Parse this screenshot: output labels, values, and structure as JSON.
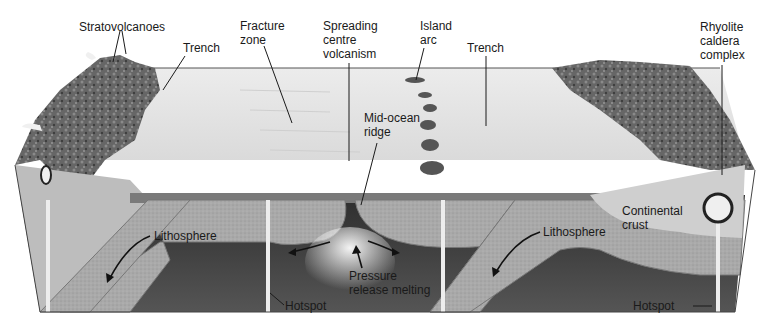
{
  "labels": {
    "stratovolcanoes": "Stratovolcanoes",
    "trench_left": "Trench",
    "fracture_zone": [
      "Fracture",
      "zone"
    ],
    "spreading_centre": [
      "Spreading",
      "centre",
      "volcanism"
    ],
    "island_arc": [
      "Island",
      "arc"
    ],
    "trench_right": "Trench",
    "rhyolite_caldera": [
      "Rhyolite",
      "caldera",
      "complex"
    ],
    "mid_ocean_ridge": [
      "Mid-ocean",
      "ridge"
    ],
    "lithosphere_left": "Lithosphere",
    "lithosphere_right": "Lithosphere",
    "continental_crust": [
      "Continental",
      "crust"
    ],
    "pressure_release": [
      "Pressure",
      "release melting"
    ],
    "hotspot_center": "Hotspot",
    "hotspot_right": "Hotspot"
  },
  "colors": {
    "ocean_surface": "#e6e6e6",
    "mountains": "#5e5e5e",
    "lithosphere": "#a8a8a8",
    "mantle": "#3a3a3a",
    "continental_crust": "#cfcfcf",
    "magma": "#f2f2f2"
  }
}
